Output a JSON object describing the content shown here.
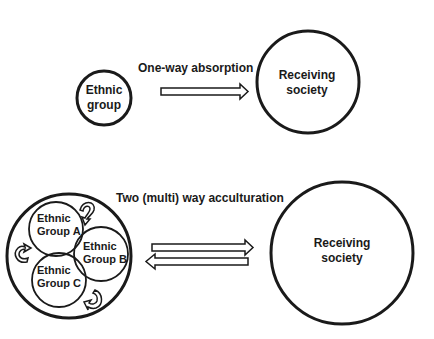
{
  "diagram": {
    "top": {
      "source": {
        "label_line1": "Ethnic",
        "label_line2": "group"
      },
      "relation": {
        "label": "One-way absorption",
        "arrow": "right-hollow-arrow"
      },
      "target": {
        "label_line1": "Receiving",
        "label_line2": "society"
      }
    },
    "bottom": {
      "relation": {
        "label": "Two (multi) way acculturation",
        "arrows": [
          "right-hollow-arrow",
          "left-hollow-arrow"
        ]
      },
      "groups": [
        {
          "label_line1": "Ethnic",
          "label_line2": "Group A"
        },
        {
          "label_line1": "Ethnic",
          "label_line2": "Group B"
        },
        {
          "label_line1": "Ethnic",
          "label_line2": "Group C"
        }
      ],
      "interaction_icons": [
        "curved-arrow-icon",
        "curved-arrow-icon",
        "curved-arrow-icon"
      ],
      "target": {
        "label_line1": "Receiving",
        "label_line2": "society"
      }
    },
    "colors": {
      "stroke": "#1a1a1a",
      "background": "#ffffff"
    }
  }
}
